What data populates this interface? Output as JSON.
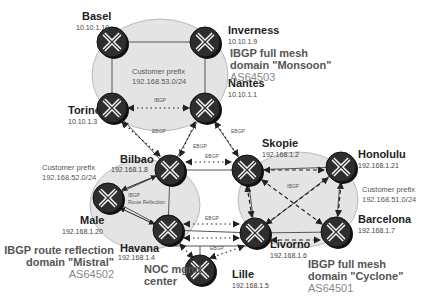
{
  "routers": [
    {
      "name": "Basel",
      "ip": "10.10.1.10",
      "cx": 112,
      "cy": 42
    },
    {
      "name": "Inverness",
      "ip": "10.10.1.9",
      "cx": 205,
      "cy": 42
    },
    {
      "name": "Torino",
      "ip": "10.10.1.3",
      "cx": 112,
      "cy": 108
    },
    {
      "name": "Nantes",
      "ip": "10.10.1.1",
      "cx": 205,
      "cy": 108
    },
    {
      "name": "Bilbao",
      "ip": "192.168.1.8",
      "cx": 170,
      "cy": 170
    },
    {
      "name": "Skopie",
      "ip": "192.168.1.2",
      "cx": 247,
      "cy": 170
    },
    {
      "name": "Male",
      "ip": "192.168.1.20",
      "cx": 108,
      "cy": 198
    },
    {
      "name": "Havana",
      "ip": "192.168.1.4",
      "cx": 168,
      "cy": 230
    },
    {
      "name": "Honolulu",
      "ip": "192.168.1.21",
      "cx": 341,
      "cy": 167
    },
    {
      "name": "Barcelona",
      "ip": "192.168.1.7",
      "cx": 336,
      "cy": 232
    },
    {
      "name": "Livorno",
      "ip": "192.168.1.6",
      "cx": 255,
      "cy": 233
    },
    {
      "name": "Lille",
      "ip": "192.168.1.5",
      "cx": 200,
      "cy": 270
    }
  ],
  "domains": {
    "monsoon": {
      "line1": "IBGP full mesh",
      "line2": "domain \"Monsoon\"",
      "asn": "AS64503",
      "prefix_label": "Customer prefix",
      "prefix": "192.168.53.0/24"
    },
    "mistral": {
      "line1": "IBGP route reflection",
      "line2": "domain \"Mistral\"",
      "asn": "AS64502",
      "prefix_label": "Customer prefix",
      "prefix": "192.168.52.0/24",
      "inner1": "IBGP",
      "inner2": "Route Reflection"
    },
    "cyclone": {
      "line1": "IBGP full mesh",
      "line2": "domain \"Cyclone\"",
      "asn": "AS64501",
      "prefix_label": "Customer prefix",
      "prefix": "192.168.51.0/24",
      "inner": "IBGP"
    }
  },
  "noc": {
    "line1": "NOC mgmt",
    "line2": "center"
  },
  "link_labels": {
    "ibgp": "IBGP",
    "ebgp": "EBGP"
  }
}
